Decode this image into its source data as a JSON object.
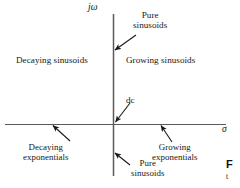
{
  "figure": {
    "kind": "s-plane-region-diagram",
    "background_color": "#ffffff",
    "axis_color": "#4d4d4d",
    "text_color": "#161616"
  },
  "axes": {
    "vertical": {
      "label": "jω",
      "name": "imaginary-axis",
      "x": 113,
      "y_top": 14,
      "y_bottom": 176
    },
    "horizontal": {
      "label": "σ",
      "name": "real-axis",
      "y": 124,
      "x_left": 5,
      "x_right": 226
    },
    "origin": {
      "x": 113,
      "y": 124
    }
  },
  "labels": {
    "pure_sinusoids_top": {
      "line1": "Pure",
      "line2": "sinusoids"
    },
    "decaying_sinusoids": "Decaying sinusoids",
    "growing_sinusoids": "Growing sinusoids",
    "dc": "dc",
    "decaying_exponentials": {
      "line1": "Decaying",
      "line2": "exponentials"
    },
    "growing_exponentials": {
      "line1": "Growing",
      "line2": "exponentials"
    },
    "pure_sinusoids_bottom": {
      "line1": "Pure",
      "line2": "sinusoids"
    }
  },
  "annotations": [
    {
      "name": "arrow-pure-sinusoids-top",
      "points_to": "upper imaginary axis",
      "from": {
        "x": 136,
        "y": 36
      },
      "to": {
        "x": 114,
        "y": 50
      }
    },
    {
      "name": "arrow-dc",
      "points_to": "origin",
      "from": {
        "x": 129,
        "y": 104
      },
      "to": {
        "x": 114,
        "y": 123
      }
    },
    {
      "name": "arrow-decaying-exponentials",
      "points_to": "negative real axis",
      "from": {
        "x": 70,
        "y": 140
      },
      "to": {
        "x": 52,
        "y": 124
      }
    },
    {
      "name": "arrow-growing-exponentials",
      "points_to": "positive real axis",
      "from": {
        "x": 170,
        "y": 141
      },
      "to": {
        "x": 160,
        "y": 124
      }
    },
    {
      "name": "arrow-pure-sinusoids-bottom",
      "points_to": "lower imaginary axis",
      "from": {
        "x": 129,
        "y": 164
      },
      "to": {
        "x": 114,
        "y": 152
      }
    }
  ],
  "caption_stub": {
    "visible_text": "F",
    "second_line": "t"
  }
}
